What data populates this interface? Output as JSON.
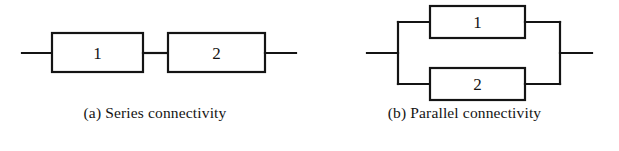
{
  "figure": {
    "background_color": "#ffffff",
    "stroke_color": "#141414",
    "label_color": "#141414"
  },
  "panels": [
    {
      "id": "series",
      "caption": "(a) Series connectivity",
      "diagram_type": "series-block-diagram",
      "blocks": [
        {
          "label": "1",
          "name": "block-1"
        },
        {
          "label": "2",
          "name": "block-2"
        }
      ]
    },
    {
      "id": "parallel",
      "caption": "(b) Parallel connectivity",
      "diagram_type": "parallel-block-diagram",
      "blocks": [
        {
          "label": "1",
          "name": "block-1"
        },
        {
          "label": "2",
          "name": "block-2"
        }
      ]
    }
  ]
}
